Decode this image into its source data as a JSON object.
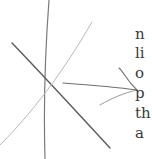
{
  "document": {
    "text_lines": [
      {
        "text": "n",
        "top": 27
      },
      {
        "text": "li",
        "top": 46
      },
      {
        "text": "o",
        "top": 66
      },
      {
        "text": "p",
        "top": 86
      },
      {
        "text": "th",
        "top": 106
      },
      {
        "text": "a",
        "top": 126
      }
    ]
  },
  "diagram": {
    "colors": {
      "dark_line": "#5a5a5a",
      "light_line": "#b8b8b8",
      "vertical_line": "#7a7a7a",
      "arrow": "#6e6e6e"
    }
  }
}
